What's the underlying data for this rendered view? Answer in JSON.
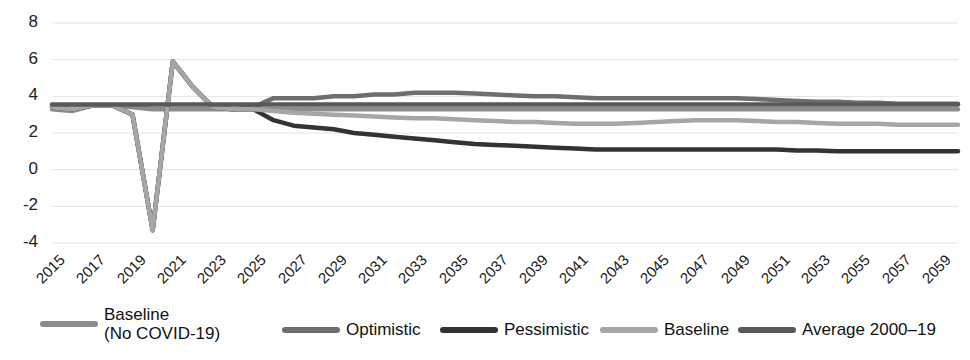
{
  "chart_data": {
    "type": "line",
    "title": "",
    "xlabel": "",
    "ylabel": "",
    "xlim": [
      2015,
      2060
    ],
    "ylim": [
      -4,
      8
    ],
    "yticks": [
      8,
      6,
      4,
      2,
      0,
      -2,
      -4
    ],
    "xticks": [
      2015,
      2017,
      2019,
      2021,
      2023,
      2025,
      2027,
      2029,
      2031,
      2033,
      2035,
      2037,
      2039,
      2041,
      2043,
      2045,
      2047,
      2049,
      2051,
      2053,
      2055,
      2057,
      2059
    ],
    "grid": true,
    "legend_position": "bottom",
    "x": [
      2015,
      2016,
      2017,
      2018,
      2019,
      2020,
      2021,
      2022,
      2023,
      2024,
      2025,
      2026,
      2027,
      2028,
      2029,
      2030,
      2031,
      2032,
      2033,
      2034,
      2035,
      2036,
      2037,
      2038,
      2039,
      2040,
      2041,
      2042,
      2043,
      2044,
      2045,
      2046,
      2047,
      2048,
      2049,
      2050,
      2051,
      2052,
      2053,
      2054,
      2055,
      2056,
      2057,
      2058,
      2059,
      2060
    ],
    "series": [
      {
        "name": "Baseline (No COVID-19)",
        "color": "#8c8c8c",
        "width": 4.5,
        "values": [
          3.3,
          3.2,
          3.5,
          3.5,
          3.4,
          3.3,
          3.3,
          3.3,
          3.3,
          3.3,
          3.3,
          3.3,
          3.3,
          3.3,
          3.3,
          3.3,
          3.3,
          3.3,
          3.3,
          3.3,
          3.3,
          3.3,
          3.3,
          3.3,
          3.3,
          3.3,
          3.3,
          3.3,
          3.3,
          3.3,
          3.3,
          3.3,
          3.3,
          3.3,
          3.3,
          3.3,
          3.3,
          3.3,
          3.3,
          3.3,
          3.3,
          3.3,
          3.3,
          3.3,
          3.3,
          3.3
        ]
      },
      {
        "name": "Optimistic",
        "color": "#6e6e6e",
        "width": 4.5,
        "values": [
          3.4,
          3.3,
          3.5,
          3.5,
          3.0,
          -3.3,
          5.9,
          4.5,
          3.4,
          3.3,
          3.4,
          3.9,
          3.9,
          3.9,
          4.0,
          4.0,
          4.1,
          4.1,
          4.2,
          4.2,
          4.2,
          4.15,
          4.1,
          4.05,
          4.0,
          4.0,
          3.95,
          3.9,
          3.9,
          3.9,
          3.9,
          3.9,
          3.9,
          3.9,
          3.9,
          3.85,
          3.8,
          3.75,
          3.7,
          3.7,
          3.65,
          3.65,
          3.6,
          3.6,
          3.6,
          3.6
        ]
      },
      {
        "name": "Pessimistic",
        "color": "#333333",
        "width": 4.5,
        "values": [
          3.4,
          3.3,
          3.5,
          3.5,
          3.0,
          -3.3,
          5.9,
          4.5,
          3.4,
          3.3,
          3.3,
          2.7,
          2.4,
          2.3,
          2.2,
          2.0,
          1.9,
          1.8,
          1.7,
          1.6,
          1.5,
          1.4,
          1.35,
          1.3,
          1.25,
          1.2,
          1.15,
          1.1,
          1.1,
          1.1,
          1.1,
          1.1,
          1.1,
          1.1,
          1.1,
          1.1,
          1.1,
          1.05,
          1.05,
          1.0,
          1.0,
          1.0,
          1.0,
          1.0,
          1.0,
          1.0
        ]
      },
      {
        "name": "Baseline",
        "color": "#a6a6a6",
        "width": 4.5,
        "values": [
          3.4,
          3.3,
          3.5,
          3.5,
          3.0,
          -3.3,
          5.9,
          4.5,
          3.4,
          3.3,
          3.3,
          3.2,
          3.1,
          3.05,
          3.0,
          2.95,
          2.9,
          2.85,
          2.8,
          2.8,
          2.75,
          2.7,
          2.65,
          2.6,
          2.6,
          2.55,
          2.5,
          2.5,
          2.5,
          2.55,
          2.6,
          2.65,
          2.7,
          2.7,
          2.7,
          2.65,
          2.6,
          2.6,
          2.55,
          2.5,
          2.5,
          2.5,
          2.45,
          2.45,
          2.45,
          2.45
        ]
      },
      {
        "name": "Average 2000–19",
        "color": "#595959",
        "width": 4.5,
        "values": [
          3.55,
          3.55,
          3.55,
          3.55,
          3.55,
          3.55,
          3.55,
          3.55,
          3.55,
          3.55,
          3.55,
          3.55,
          3.55,
          3.55,
          3.55,
          3.55,
          3.55,
          3.55,
          3.55,
          3.55,
          3.55,
          3.55,
          3.55,
          3.55,
          3.55,
          3.55,
          3.55,
          3.55,
          3.55,
          3.55,
          3.55,
          3.55,
          3.55,
          3.55,
          3.55,
          3.55,
          3.55,
          3.55,
          3.55,
          3.55,
          3.55,
          3.55,
          3.55,
          3.55,
          3.55,
          3.55
        ]
      }
    ]
  },
  "axis": {
    "y_labels": [
      "8",
      "6",
      "4",
      "2",
      "0",
      "-2",
      "-4"
    ],
    "x_labels": [
      "2015",
      "2017",
      "2019",
      "2021",
      "2023",
      "2025",
      "2027",
      "2029",
      "2031",
      "2033",
      "2035",
      "2037",
      "2039",
      "2041",
      "2043",
      "2045",
      "2047",
      "2049",
      "2051",
      "2053",
      "2055",
      "2057",
      "2059"
    ]
  },
  "legend": {
    "items": [
      {
        "label": "Baseline\n(No COVID-19)",
        "color": "#8c8c8c"
      },
      {
        "label": "Optimistic",
        "color": "#6e6e6e"
      },
      {
        "label": "Pessimistic",
        "color": "#333333"
      },
      {
        "label": "Baseline",
        "color": "#a6a6a6"
      },
      {
        "label": "Average 2000–19",
        "color": "#595959"
      }
    ]
  },
  "style": {
    "gridline_color": "#e3e3e3",
    "background": "#ffffff"
  }
}
